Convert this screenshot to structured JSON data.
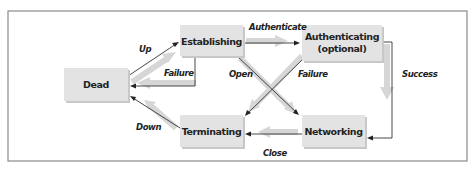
{
  "diagram": {
    "type": "state-transition",
    "states": {
      "dead": "Dead",
      "establishing": "Establishing",
      "authenticating_line1": "Authenticating",
      "authenticating_line2": "(optional)",
      "networking": "Networking",
      "terminating": "Terminating"
    },
    "transitions": {
      "up": "Up",
      "failure_establishing": "Failure",
      "authenticate": "Authenticate",
      "open": "Open",
      "failure_authenticating": "Failure",
      "success": "Success",
      "close": "Close",
      "down": "Down"
    },
    "edges": [
      {
        "from": "Dead",
        "to": "Establishing",
        "label": "Up"
      },
      {
        "from": "Establishing",
        "to": "Dead",
        "label": "Failure"
      },
      {
        "from": "Establishing",
        "to": "Authenticating (optional)",
        "label": "Authenticate"
      },
      {
        "from": "Establishing",
        "to": "Networking",
        "label": "Open"
      },
      {
        "from": "Authenticating (optional)",
        "to": "Terminating",
        "label": "Failure"
      },
      {
        "from": "Authenticating (optional)",
        "to": "Networking",
        "label": "Success"
      },
      {
        "from": "Networking",
        "to": "Terminating",
        "label": "Close"
      },
      {
        "from": "Terminating",
        "to": "Dead",
        "label": "Down"
      }
    ],
    "colors": {
      "box_fill": "#e3e3e3",
      "ghost_arrow": "#d6d6d6",
      "line": "#333333",
      "frame": "#8a8a8a"
    }
  }
}
